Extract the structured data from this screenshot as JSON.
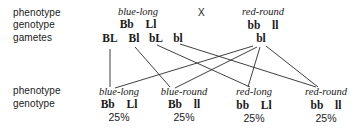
{
  "row_labels": {
    "top": {
      "phenotype": "phenotype",
      "genotype": "genotype",
      "gametes": "gametes"
    },
    "bottom": {
      "phenotype": "phenotype",
      "genotype": "genotype"
    }
  },
  "cross_symbol": "X",
  "parent1": {
    "phenotype": "blue-long",
    "genotype": "Bb  Ll",
    "gametes": [
      "BL",
      "Bl",
      "bL",
      "bl"
    ]
  },
  "parent2": {
    "phenotype": "red-round",
    "genotype": "bb  ll",
    "gametes": [
      "bl"
    ]
  },
  "offspring": [
    {
      "phenotype": "blue-long",
      "genotype": "Bb  Ll",
      "percent": "25%"
    },
    {
      "phenotype": "blue-round",
      "genotype": "Bb  ll",
      "percent": "25%"
    },
    {
      "phenotype": "red-long",
      "genotype": "bb  Ll",
      "percent": "25%"
    },
    {
      "phenotype": "red-round",
      "genotype": "bb  ll",
      "percent": "25%"
    }
  ]
}
